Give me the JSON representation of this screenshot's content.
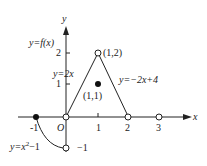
{
  "diagram": {
    "function_label": "y=f(x)",
    "axes": {
      "x_label": "x",
      "y_label": "y",
      "origin_label": "O",
      "x_ticks": [
        "-1",
        "1",
        "2",
        "3"
      ],
      "y_ticks": [
        "1",
        "2",
        "-1"
      ]
    },
    "pieces": [
      {
        "label": "y=x²−1",
        "domain": "[-1, 0)",
        "from": [
          -1,
          0
        ],
        "to": [
          0,
          -1
        ]
      },
      {
        "label": "y=2x",
        "domain": "(0, 1)",
        "from": [
          0,
          0
        ],
        "to": [
          1,
          2
        ]
      },
      {
        "label": "y=−2x+4",
        "domain": "(1, 2)",
        "from": [
          1,
          2
        ],
        "to": [
          2,
          0
        ]
      }
    ],
    "points": [
      {
        "label": "(1,2)",
        "x": 1,
        "y": 2,
        "style": "open"
      },
      {
        "label": "(1,1)",
        "x": 1,
        "y": 1,
        "style": "filled"
      },
      {
        "label": "",
        "x": 0,
        "y": 0,
        "style": "open"
      },
      {
        "label": "",
        "x": 2,
        "y": 0,
        "style": "open"
      },
      {
        "label": "",
        "x": 3,
        "y": 0,
        "style": "open"
      },
      {
        "label": "",
        "x": -1,
        "y": 0,
        "style": "filled"
      },
      {
        "label": "",
        "x": 0,
        "y": -1,
        "style": "open"
      }
    ],
    "labels": {
      "f": "y=f(x)",
      "piece1": "y=x",
      "piece1_sup": "2",
      "piece1_tail": "−1",
      "piece2": "y=2x",
      "piece3": "y=−2x+4",
      "p12": "(1,2)",
      "p11": "(1,1)",
      "neg1_x": "-1",
      "neg1_y": "−1",
      "one_x": "1",
      "two_x": "2",
      "three_x": "3",
      "one_y": "1",
      "two_y": "2",
      "origin": "O",
      "x": "x",
      "y": "y"
    }
  }
}
